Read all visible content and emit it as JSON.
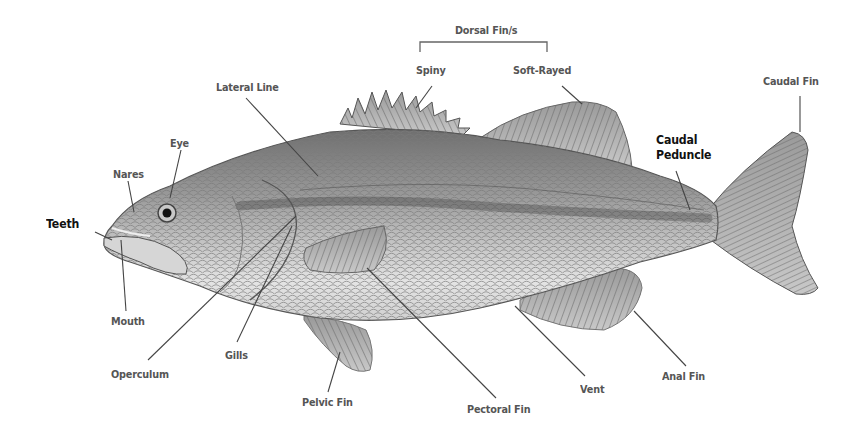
{
  "diagram": {
    "group_label": "Dorsal Fin/s",
    "labels": {
      "dorsal_spiny": "Spiny",
      "dorsal_soft": "Soft-Rayed",
      "lateral_line": "Lateral Line",
      "caudal_fin": "Caudal Fin",
      "caudal_peduncle_1": "Caudal",
      "caudal_peduncle_2": "Peduncle",
      "eye": "Eye",
      "nares": "Nares",
      "teeth": "Teeth",
      "mouth": "Mouth",
      "operculum": "Operculum",
      "gills": "Gills",
      "pelvic_fin": "Pelvic Fin",
      "pectoral_fin": "Pectoral Fin",
      "vent": "Vent",
      "anal_fin": "Anal Fin"
    },
    "colors": {
      "label_text": "#555555",
      "emphasis_text": "#111111",
      "leader_line": "#444444",
      "background": "#ffffff"
    }
  }
}
